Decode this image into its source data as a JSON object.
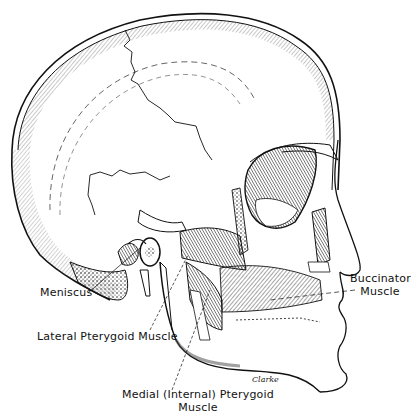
{
  "figure": {
    "signature": "Clarke"
  },
  "labels": {
    "meniscus": "Meniscus",
    "lateral_pterygoid": "Lateral Pterygoid Muscle",
    "medial_pterygoid_line1": "Medial (Internal) Pterygoid",
    "medial_pterygoid_line2": "Muscle",
    "buccinator_line1": "Buccinator",
    "buccinator_line2": "Muscle"
  },
  "colors": {
    "ink": "#111111",
    "background": "#ffffff",
    "shading": "#555555"
  }
}
